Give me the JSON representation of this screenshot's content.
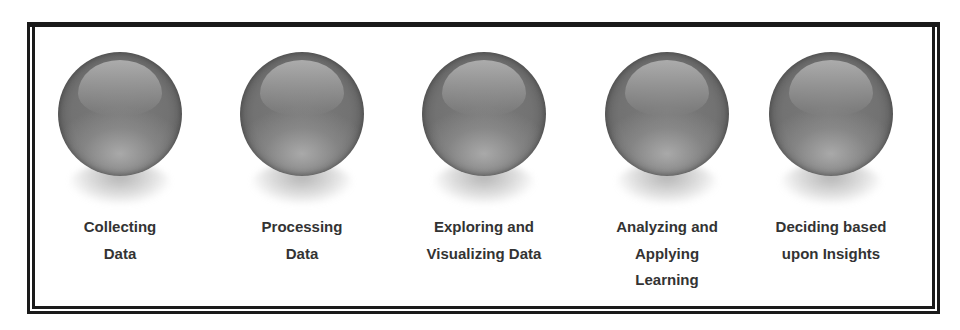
{
  "diagram": {
    "type": "process-steps",
    "colors": {
      "frame": "#1a1a1a",
      "sphere_base": "#727272",
      "sphere_highlight": "#a8a8a8",
      "label_text": "#333333",
      "background": "#ffffff"
    },
    "steps": [
      {
        "icon": "sphere-icon",
        "label_lines": [
          "Collecting",
          "Data"
        ]
      },
      {
        "icon": "sphere-icon",
        "label_lines": [
          "Processing",
          "Data"
        ]
      },
      {
        "icon": "sphere-icon",
        "label_lines": [
          "Exploring and",
          "Visualizing Data"
        ]
      },
      {
        "icon": "sphere-icon",
        "label_lines": [
          "Analyzing and",
          "Applying",
          "Learning"
        ]
      },
      {
        "icon": "sphere-icon",
        "label_lines": [
          "Deciding based",
          "upon Insights"
        ]
      }
    ]
  }
}
